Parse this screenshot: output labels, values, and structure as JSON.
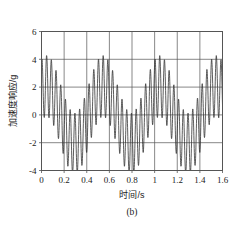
{
  "figure": {
    "caption": "(b)",
    "background_color": "#ffffff"
  },
  "chart_data": {
    "type": "line",
    "title": "",
    "subtitle": "",
    "caption": "(b)",
    "xlabel": "时间/s",
    "ylabel": "加速度响应/g",
    "xlim": [
      0,
      1.6
    ],
    "ylim": [
      -4,
      6
    ],
    "xticks": [
      0,
      0.2,
      0.4,
      0.6,
      0.8,
      1,
      1.2,
      1.4,
      1.6
    ],
    "xticklabels": [
      "0",
      "0.2",
      "0.4",
      "0.6",
      "0.8",
      "1",
      "1.2",
      "1.4",
      "1.6"
    ],
    "yticks": [
      -4,
      -2,
      0,
      2,
      4,
      6
    ],
    "yticklabels": [
      "-4",
      "-2",
      "0",
      "2",
      "4",
      "6"
    ],
    "grid": true,
    "grid_color": "#555555",
    "legend": null,
    "line_color": "#333333",
    "line_width": 0.8,
    "series": [
      {
        "name": "加速度响应",
        "model": "beat",
        "amplitude": 2.2,
        "carrier_freq_hz": 24.0,
        "beat_freq_hz": 2.0,
        "phase": 0.55,
        "offset": 0.2,
        "x_start": 0,
        "x_end": 1.6,
        "samples": 1600,
        "peak_times": [
          0.04,
          0.29,
          0.535,
          0.785,
          1.035,
          1.285,
          1.535
        ],
        "peak_values": [
          4.05,
          4.05,
          4.05,
          4.05,
          4.05,
          4.05,
          4.05
        ],
        "trough_values": [
          -3.0,
          -3.0,
          -3.0,
          -3.0,
          -3.0,
          -3.0,
          -3.0
        ],
        "minor_peak_values": [
          0.65,
          0.45,
          0.6,
          0.5,
          0.6,
          0.5,
          0.65
        ]
      }
    ]
  }
}
